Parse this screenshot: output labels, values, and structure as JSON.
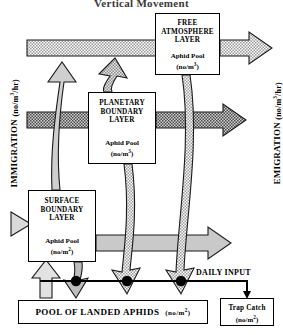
{
  "title": "Vertical Movement",
  "boxes": {
    "free_atmosphere": {
      "name": "free-atmosphere-layer",
      "line1": "FREE",
      "line2": "ATMOSPHERE",
      "line3": "LAYER",
      "pool_label": "Aphid  Pool",
      "pool_units": "(no/m",
      "pool_exp": "3",
      "pool_units_end": ")"
    },
    "planetary_boundary": {
      "name": "planetary-boundary-layer",
      "line1": "PLANETARY",
      "line2": "BOUNDARY",
      "line3": "LAYER",
      "pool_label": "Aphid  Pool",
      "pool_units": "(no/m",
      "pool_exp": "3",
      "pool_units_end": ")"
    },
    "surface_boundary": {
      "name": "surface-boundary-layer",
      "line1": "SURFACE",
      "line2": "BOUNDARY",
      "line3": "LAYER",
      "pool_label": "Aphid  Pool",
      "pool_units": "(no/m",
      "pool_exp": "2",
      "pool_units_end": ")"
    },
    "pool_of_landed_aphids": {
      "name": "pool-of-landed-aphids",
      "label": "POOL  OF  LANDED  APHIDS",
      "units": "(no/m",
      "units_exp": "2",
      "units_end": ")"
    },
    "trap_catch": {
      "name": "trap-catch",
      "line1": "Trap  Catch",
      "units": "(no/m",
      "units_exp": "2",
      "units_end": ")"
    }
  },
  "labels": {
    "immigration": "IMMIGRATION",
    "immigration_units": "(no/m",
    "immigration_exp": "3",
    "immigration_units_end": "/hr)",
    "emigration": "EMIGRATION",
    "emigration_units": "(no/m",
    "emigration_exp": "3",
    "emigration_units_end": "/hr)",
    "daily_input": "DAILY  INPUT"
  },
  "colors": {
    "outline": "#000000",
    "fill_light": "#d9d9d9",
    "fill_white": "#ffffff",
    "fill_dark": "#8c8c8c",
    "node": "#000000"
  },
  "flows": [
    {
      "name": "immigration-to-free-atmosphere",
      "direction": "right",
      "layer": "free-atmosphere"
    },
    {
      "name": "immigration-to-planetary-boundary",
      "direction": "right",
      "layer": "planetary-boundary"
    },
    {
      "name": "immigration-to-surface-boundary",
      "direction": "right",
      "layer": "surface-boundary"
    },
    {
      "name": "emigration-from-free-atmosphere",
      "direction": "right",
      "layer": "free-atmosphere"
    },
    {
      "name": "emigration-from-planetary-boundary",
      "direction": "right",
      "layer": "planetary-boundary"
    },
    {
      "name": "emigration-from-surface-boundary",
      "direction": "right",
      "layer": "surface-boundary"
    },
    {
      "name": "ascent-surface-to-free-atmosphere",
      "direction": "up"
    },
    {
      "name": "ascent-planetary-to-free-atmosphere",
      "direction": "up"
    },
    {
      "name": "descent-free-atmosphere-to-pool",
      "direction": "down"
    },
    {
      "name": "descent-planetary-to-pool",
      "direction": "down"
    },
    {
      "name": "descent-surface-to-pool",
      "direction": "down"
    },
    {
      "name": "takeoff-pool-to-surface",
      "direction": "up"
    },
    {
      "name": "pool-to-trap-catch",
      "direction": "down"
    }
  ]
}
